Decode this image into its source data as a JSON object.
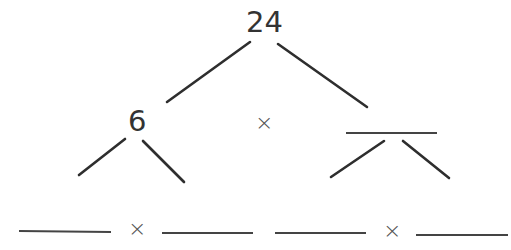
{
  "factor_tree": {
    "root": "24",
    "level1": {
      "left": "6",
      "operator": "×",
      "right": ""
    },
    "level2": {
      "left_pair": [
        "",
        ""
      ],
      "left_operator": "×",
      "right_pair": [
        "",
        ""
      ],
      "right_operator": "×"
    }
  },
  "colors": {
    "line": "#2e2e2e",
    "blank": "#444444",
    "text": "#333333"
  }
}
